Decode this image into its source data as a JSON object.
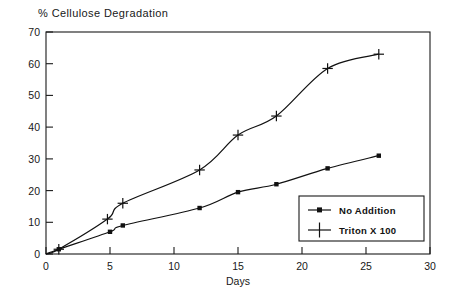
{
  "chart_data": {
    "type": "line",
    "title": "% Cellulose Degradation",
    "xlabel": "Days",
    "ylabel": "",
    "xlim": [
      0,
      30
    ],
    "ylim": [
      0,
      70
    ],
    "xticks": [
      "0",
      "5",
      "10",
      "15",
      "20",
      "25",
      "30"
    ],
    "xtick_values": [
      0,
      5,
      10,
      15,
      20,
      25,
      30
    ],
    "yticks": [
      "0",
      "10",
      "20",
      "30",
      "40",
      "50",
      "60",
      "70"
    ],
    "ytick_values": [
      0,
      10,
      20,
      30,
      40,
      50,
      60,
      70
    ],
    "grid": false,
    "legend_position": "lower right",
    "series": [
      {
        "name": "No Addition",
        "marker": "square",
        "x": [
          0,
          1,
          5,
          6,
          12,
          15,
          18,
          22,
          26
        ],
        "y": [
          0,
          1.5,
          7,
          9,
          14.5,
          19.5,
          22,
          27,
          31
        ]
      },
      {
        "name": "Triton X 100",
        "marker": "plus",
        "x": [
          0,
          1,
          4.8,
          6,
          12,
          15,
          18,
          22,
          26
        ],
        "y": [
          0,
          1.5,
          11,
          16,
          26.5,
          37.5,
          43.5,
          58.5,
          63
        ]
      }
    ]
  },
  "legend": {
    "entries": [
      {
        "label": "No Addition",
        "marker": "square-line"
      },
      {
        "label": "Triton X 100",
        "marker": "plus"
      }
    ]
  },
  "colors": {
    "axis": "#1a1a1a",
    "series_no_addition": "#111111",
    "series_triton": "#111111",
    "background": "#ffffff"
  }
}
